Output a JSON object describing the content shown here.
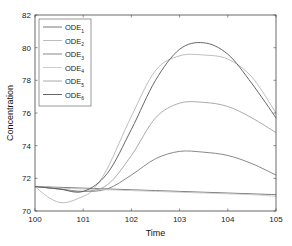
{
  "chart_data": {
    "type": "line",
    "title": "",
    "xlabel": "Time",
    "ylabel": "Concentration",
    "xlim": [
      100,
      105
    ],
    "ylim": [
      70,
      82
    ],
    "xticks": [
      100,
      101,
      102,
      103,
      104,
      105
    ],
    "yticks": [
      70,
      72,
      74,
      76,
      78,
      80,
      82
    ],
    "grid": false,
    "legend_position": "upper left",
    "series": [
      {
        "name": "ODE",
        "sub": "1",
        "color": "#6a6a6a",
        "x": [
          100,
          100.5,
          101,
          101.5,
          102,
          102.5,
          103,
          103.5,
          104,
          104.5,
          105
        ],
        "y": [
          71.5,
          71.45,
          71.4,
          71.35,
          71.3,
          71.25,
          71.2,
          71.15,
          71.1,
          71.05,
          71.0
        ]
      },
      {
        "name": "ODE",
        "sub": "2",
        "color": "#b5b5b5",
        "x": [
          100,
          100.3,
          100.6,
          101,
          101.2,
          101.5,
          102,
          102.5,
          103,
          103.5,
          104,
          104.5,
          105
        ],
        "y": [
          71.5,
          70.8,
          70.5,
          70.9,
          71.3,
          72.6,
          75.8,
          78.6,
          79.5,
          79.55,
          79.3,
          78.2,
          76.0
        ]
      },
      {
        "name": "ODE",
        "sub": "3",
        "color": "#7a7a7a",
        "x": [
          100,
          100.5,
          101,
          101.5,
          102,
          102.5,
          103,
          103.5,
          104,
          104.5,
          105
        ],
        "y": [
          71.5,
          71.35,
          71.2,
          71.35,
          72.2,
          73.2,
          73.65,
          73.6,
          73.4,
          72.9,
          72.2
        ]
      },
      {
        "name": "ODE",
        "sub": "4",
        "color": "#c8c8c8",
        "x": [
          100,
          100.5,
          101,
          101.5,
          102,
          102.5,
          103,
          103.5,
          104,
          104.5,
          105
        ],
        "y": [
          71.5,
          71.4,
          71.35,
          71.3,
          71.25,
          71.2,
          71.15,
          71.1,
          71.05,
          71.0,
          70.9
        ]
      },
      {
        "name": "ODE",
        "sub": "5",
        "color": "#a0a0a0",
        "x": [
          100,
          100.5,
          101,
          101.5,
          102,
          102.5,
          103,
          103.5,
          104,
          104.5,
          105
        ],
        "y": [
          71.5,
          71.35,
          71.2,
          71.6,
          73.4,
          75.7,
          76.6,
          76.65,
          76.4,
          75.7,
          74.8
        ]
      },
      {
        "name": "ODE",
        "sub": "6",
        "color": "#555555",
        "x": [
          100,
          100.5,
          101,
          101.5,
          102,
          102.5,
          103,
          103.5,
          104,
          104.5,
          105
        ],
        "y": [
          71.5,
          71.35,
          71.2,
          72.3,
          75.0,
          78.0,
          79.9,
          80.3,
          79.6,
          77.8,
          75.7
        ]
      }
    ]
  }
}
